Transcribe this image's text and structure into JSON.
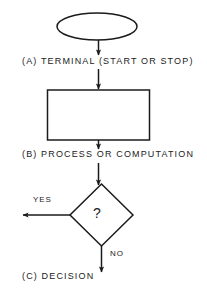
{
  "diagram": {
    "background_color": "#ffffff",
    "stroke_color": "#1b1b1b",
    "steps": [
      {
        "key": "terminal",
        "symbol": "ellipse",
        "label": "(A)  TERMINAL (START OR STOP)"
      },
      {
        "key": "process",
        "symbol": "rectangle",
        "label": "(B)  PROCESS OR COMPUTATION"
      },
      {
        "key": "decision",
        "symbol": "diamond",
        "label": "(C)  DECISION",
        "inner_text": "?",
        "branches": [
          {
            "key": "yes",
            "label": "YES",
            "direction": "left"
          },
          {
            "key": "no",
            "label": "NO",
            "direction": "down"
          }
        ]
      }
    ]
  }
}
